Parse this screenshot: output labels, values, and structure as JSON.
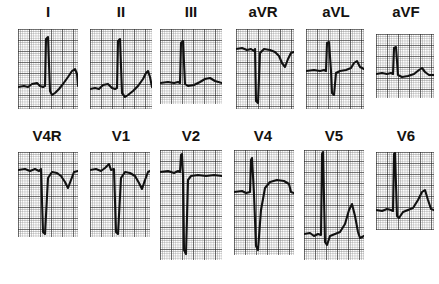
{
  "figure": {
    "type": "ecg-12-lead",
    "background_color": "#ffffff",
    "trace_color": "#111111",
    "grid_fine_color": "#6e6e6e",
    "grid_bold_color": "#1c1c1c",
    "label_color": "#14120f",
    "width": 439,
    "height": 284,
    "rows": 2,
    "columns": 6,
    "grid_small_box_px": 2.2,
    "grid_large_box_px": 11
  },
  "leads": [
    {
      "name": "I",
      "label": "I",
      "row": 1,
      "column": 1,
      "label_font_size": 15,
      "label_x": 18,
      "label_y": 4,
      "label_width": 60,
      "strip": {
        "x": 18,
        "y": 29,
        "w": 60,
        "h": 80
      },
      "baseline_frac": 0.72,
      "morphology": "tall R wave, ST elevation with rising T wave",
      "path": "M0,58 L6,57 L10,58 L14,55 L19,54 L22,57 L25,58 L27,57 L28,10 L30,8 L32,62 L34,66 L37,64 L41,60 L45,55 L50,48 L54,42 L57,40 L59,45 L60,57"
    },
    {
      "name": "II",
      "label": "II",
      "row": 1,
      "column": 2,
      "label_font_size": 15,
      "label_x": 90,
      "label_y": 4,
      "label_width": 62,
      "strip": {
        "x": 90,
        "y": 29,
        "w": 62,
        "h": 80
      },
      "baseline_frac": 0.74,
      "morphology": "tall R wave, upsloping ST segment into T wave",
      "path": "M0,60 L5,59 L9,60 L13,56 L18,55 L22,59 L25,60 L27,59 L28,12 L30,10 L32,64 L35,68 L38,66 L43,62 L48,57 L53,50 L56,44 L58,42 L60,48 L62,58"
    },
    {
      "name": "III",
      "label": "III",
      "row": 1,
      "column": 3,
      "label_font_size": 15,
      "label_x": 160,
      "label_y": 4,
      "label_width": 62,
      "strip": {
        "x": 160,
        "y": 29,
        "w": 62,
        "h": 75
      },
      "baseline_frac": 0.7,
      "morphology": "narrow tall R wave, flat baseline, low broad T wave",
      "path": "M0,54 L8,53 L14,54 L18,53 L20,54 L21,14 L23,12 L25,55 L28,57 L34,56 L40,53 L45,50 L50,49 L55,52 L62,54"
    },
    {
      "name": "aVR",
      "label": "aVR",
      "row": 1,
      "column": 4,
      "label_font_size": 15,
      "label_x": 232,
      "label_y": 4,
      "label_width": 62,
      "strip": {
        "x": 236,
        "y": 29,
        "w": 58,
        "h": 80
      },
      "baseline_frac": 0.28,
      "morphology": "deep QS complex, inverted T wave",
      "path": "M0,20 L6,19 L11,21 L15,20 L18,22 L19,20 L20,72 L22,74 L24,24 L28,20 L34,21 L39,23 L43,27 L46,34 L49,38 L52,30 L55,24 L58,23"
    },
    {
      "name": "aVL",
      "label": "aVL",
      "row": 1,
      "column": 5,
      "label_font_size": 15,
      "label_x": 306,
      "label_y": 4,
      "label_width": 60,
      "strip": {
        "x": 306,
        "y": 29,
        "w": 58,
        "h": 80
      },
      "baseline_frac": 0.52,
      "morphology": "RS complex, small upright T wave",
      "path": "M0,42 L8,41 L14,42 L18,41 L20,42 L21,14 L23,13 L25,42 L26,64 L28,66 L30,44 L34,42 L40,41 L45,39 L48,34 L51,32 L54,38 L58,40"
    },
    {
      "name": "aVF",
      "label": "aVF",
      "row": 1,
      "column": 6,
      "label_font_size": 15,
      "label_x": 376,
      "label_y": 4,
      "label_width": 60,
      "strip": {
        "x": 376,
        "y": 34,
        "w": 58,
        "h": 64
      },
      "baseline_frac": 0.62,
      "morphology": "narrow R wave, low rounded T wave",
      "path": "M0,40 L6,39 L11,40 L15,39 L17,40 L18,14 L20,13 L22,41 L26,43 L32,42 L38,40 L43,36 L46,34 L49,38 L53,41 L58,41"
    },
    {
      "name": "V4R",
      "label": "V4R",
      "row": 2,
      "column": 1,
      "label_font_size": 15,
      "label_x": 14,
      "label_y": 128,
      "label_width": 66,
      "strip": {
        "x": 18,
        "y": 152,
        "w": 60,
        "h": 85
      },
      "baseline_frac": 0.22,
      "morphology": "rS complex with deep S wave, inverted T wave",
      "path": "M0,18 L7,17 L12,19 L17,17 L21,19 L23,17 L25,80 L27,82 L30,26 L34,20 L39,21 L43,24 L47,30 L50,36 L53,28 L56,20 L60,19"
    },
    {
      "name": "V1",
      "label": "V1",
      "row": 2,
      "column": 2,
      "label_font_size": 15,
      "label_x": 90,
      "label_y": 128,
      "label_width": 62,
      "strip": {
        "x": 90,
        "y": 152,
        "w": 60,
        "h": 85
      },
      "baseline_frac": 0.22,
      "morphology": "rS complex with deep S wave, inverted terminal T wave",
      "path": "M0,18 L6,17 L11,19 L15,16 L19,12 L21,18 L24,17 L26,80 L28,82 L31,26 L35,20 L40,21 L45,24 L49,31 L52,37 L55,28 L58,20 L60,19"
    },
    {
      "name": "V2",
      "label": "V2",
      "row": 2,
      "column": 3,
      "label_font_size": 15,
      "label_x": 160,
      "label_y": 128,
      "label_width": 62,
      "strip": {
        "x": 160,
        "y": 150,
        "w": 62,
        "h": 110
      },
      "baseline_frac": 0.22,
      "morphology": "very deep S wave extending below panel, flat isoelectric ST segment",
      "path": "M0,22 L8,21 L14,23 L18,21 L20,22 L21,5 L22,4 L23,26 L24,100 L26,104 L28,30 L31,26 L38,25 L46,26 L54,25 L62,26"
    },
    {
      "name": "V4",
      "label": "V4",
      "row": 2,
      "column": 4,
      "label_font_size": 15,
      "label_x": 232,
      "label_y": 128,
      "label_width": 62,
      "strip": {
        "x": 234,
        "y": 150,
        "w": 60,
        "h": 105
      },
      "baseline_frac": 0.4,
      "morphology": "deep S wave with marked coved ST elevation",
      "path": "M0,42 L8,41 L12,43 L16,42 L17,10 L18,8 L20,44 L22,96 L24,100 L27,60 L31,38 L36,32 L43,30 L50,31 L55,34 L57,42 L60,43"
    },
    {
      "name": "V5",
      "label": "V5",
      "row": 2,
      "column": 5,
      "label_font_size": 15,
      "label_x": 304,
      "label_y": 128,
      "label_width": 60,
      "strip": {
        "x": 304,
        "y": 150,
        "w": 60,
        "h": 110
      },
      "baseline_frac": 0.76,
      "morphology": "very tall R wave above panel, tall peaked T wave",
      "path": "M0,84 L6,83 L10,86 L14,84 L17,85 L18,4 L19,2 L21,92 L23,95 L26,86 L31,84 L36,82 L41,74 L45,60 L48,54 L51,66 L54,82 L56,88 L60,86"
    },
    {
      "name": "V6",
      "label": "V6",
      "row": 2,
      "column": 6,
      "label_font_size": 15,
      "label_x": 376,
      "label_y": 128,
      "label_width": 60,
      "strip": {
        "x": 376,
        "y": 152,
        "w": 58,
        "h": 78
      },
      "baseline_frac": 0.72,
      "morphology": "tall R wave above panel, ST elevation with rounded T wave",
      "path": "M0,58 L6,59 L11,57 L15,58 L17,59 L18,2 L19,1 L21,64 L23,66 L27,60 L32,58 L37,56 L42,48 L46,40 L49,38 L52,48 L55,57 L58,58"
    }
  ]
}
